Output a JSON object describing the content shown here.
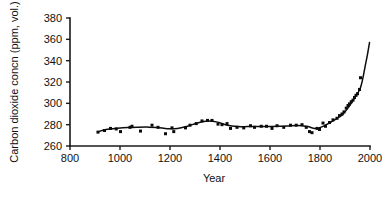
{
  "figure": {
    "background_color": "#ffffff",
    "ink_color": "#111111"
  },
  "chart_data": {
    "type": "scatter",
    "title": "",
    "subtitle": "",
    "xlabel": "Year",
    "ylabel": "Carbon dioxide concn (ppm, vol.)",
    "xlim": [
      800,
      2000
    ],
    "ylim": [
      260,
      380
    ],
    "xticks": [
      800,
      1000,
      1200,
      1400,
      1600,
      1800,
      2000
    ],
    "xtick_labels": [
      "800",
      "1000",
      "1200",
      "1400",
      "1600",
      "1800",
      "2000"
    ],
    "yticks": [
      260,
      280,
      300,
      320,
      340,
      360,
      380
    ],
    "ytick_labels": [
      "260",
      "280",
      "300",
      "320",
      "340",
      "360",
      "380"
    ],
    "grid": false,
    "legend": false,
    "legend_position": "none",
    "marker_style": "square",
    "marker_color": "#0b0b0b",
    "line_color": "#0d0d0d",
    "series": [
      {
        "name": "Ice-core CO2 measurements",
        "type": "scatter",
        "points": [
          [
            912,
            273.0
          ],
          [
            938,
            274.5
          ],
          [
            962,
            276.5
          ],
          [
            985,
            276.0
          ],
          [
            1002,
            273.5
          ],
          [
            1040,
            277.5
          ],
          [
            1048,
            278.5
          ],
          [
            1082,
            274.0
          ],
          [
            1128,
            279.5
          ],
          [
            1152,
            277.5
          ],
          [
            1182,
            271.5
          ],
          [
            1208,
            277.0
          ],
          [
            1215,
            273.5
          ],
          [
            1262,
            277.0
          ],
          [
            1280,
            279.5
          ],
          [
            1305,
            281.0
          ],
          [
            1328,
            283.5
          ],
          [
            1350,
            284.0
          ],
          [
            1368,
            284.0
          ],
          [
            1392,
            280.5
          ],
          [
            1408,
            280.0
          ],
          [
            1428,
            281.0
          ],
          [
            1442,
            276.5
          ],
          [
            1468,
            277.5
          ],
          [
            1495,
            277.0
          ],
          [
            1522,
            279.0
          ],
          [
            1538,
            277.5
          ],
          [
            1565,
            278.5
          ],
          [
            1586,
            278.5
          ],
          [
            1608,
            276.5
          ],
          [
            1628,
            279.0
          ],
          [
            1655,
            277.5
          ],
          [
            1682,
            279.5
          ],
          [
            1705,
            279.5
          ],
          [
            1728,
            280.0
          ],
          [
            1745,
            277.5
          ],
          [
            1758,
            273.5
          ],
          [
            1768,
            272.5
          ],
          [
            1788,
            276.5
          ],
          [
            1798,
            275.5
          ],
          [
            1812,
            281.5
          ],
          [
            1822,
            278.5
          ],
          [
            1838,
            282.0
          ],
          [
            1852,
            284.5
          ],
          [
            1868,
            286.0
          ],
          [
            1878,
            288.5
          ],
          [
            1888,
            290.0
          ],
          [
            1896,
            292.0
          ],
          [
            1905,
            295.5
          ],
          [
            1912,
            298.0
          ],
          [
            1918,
            299.5
          ],
          [
            1925,
            301.5
          ],
          [
            1932,
            303.0
          ],
          [
            1938,
            305.5
          ],
          [
            1944,
            307.5
          ],
          [
            1950,
            309.0
          ],
          [
            1958,
            313.0
          ],
          [
            1962,
            324.0
          ]
        ]
      },
      {
        "name": "Fitted smooth trend",
        "type": "line",
        "points": [
          [
            910,
            273.2
          ],
          [
            950,
            275.6
          ],
          [
            990,
            276.6
          ],
          [
            1030,
            277.3
          ],
          [
            1070,
            277.6
          ],
          [
            1110,
            277.7
          ],
          [
            1150,
            277.4
          ],
          [
            1190,
            276.2
          ],
          [
            1230,
            276.4
          ],
          [
            1270,
            278.6
          ],
          [
            1310,
            281.6
          ],
          [
            1350,
            283.4
          ],
          [
            1390,
            282.4
          ],
          [
            1430,
            279.4
          ],
          [
            1470,
            278.2
          ],
          [
            1510,
            278.2
          ],
          [
            1550,
            278.3
          ],
          [
            1590,
            278.2
          ],
          [
            1630,
            278.4
          ],
          [
            1670,
            278.8
          ],
          [
            1710,
            279.3
          ],
          [
            1750,
            278.2
          ],
          [
            1780,
            276.4
          ],
          [
            1810,
            278.2
          ],
          [
            1840,
            282.0
          ],
          [
            1870,
            286.2
          ],
          [
            1890,
            289.4
          ],
          [
            1910,
            295.0
          ],
          [
            1930,
            302.0
          ],
          [
            1945,
            307.5
          ],
          [
            1960,
            313.5
          ],
          [
            1970,
            322.0
          ],
          [
            1980,
            334.0
          ],
          [
            1990,
            346.0
          ],
          [
            1998,
            357.0
          ]
        ]
      }
    ]
  }
}
